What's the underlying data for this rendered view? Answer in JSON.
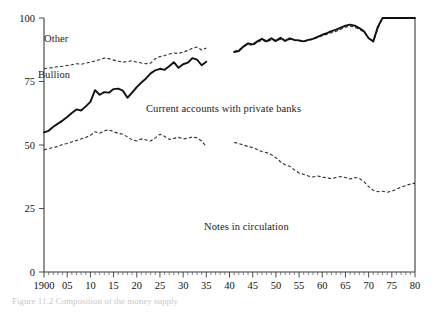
{
  "figure": {
    "caption": "Figure 11.2  Composition of the money supply"
  },
  "labels": {
    "other": "Other",
    "bullion": "Bullion",
    "current_accounts": "Current accounts with private banks",
    "notes": "Notes in circulation"
  },
  "chart_data": {
    "type": "line",
    "title": "",
    "xlabel": "",
    "ylabel": "",
    "xlim": [
      1900,
      1980
    ],
    "ylim": [
      0,
      100
    ],
    "grid": false,
    "legend": "inline-annotations",
    "ytick_labels": [
      "0",
      "25",
      "50",
      "75",
      "100"
    ],
    "ytick_values": [
      0,
      25,
      50,
      75,
      100
    ],
    "xtick_labels": [
      "1900",
      "05",
      "10",
      "15",
      "20",
      "25",
      "30",
      "35",
      "40",
      "45",
      "50",
      "55",
      "60",
      "65",
      "70",
      "75",
      "80"
    ],
    "xtick_values": [
      1900,
      1905,
      1910,
      1915,
      1920,
      1925,
      1930,
      1935,
      1940,
      1945,
      1950,
      1955,
      1960,
      1965,
      1970,
      1975,
      1980
    ],
    "x_minor_interval": 1,
    "annotations": [
      {
        "text": "Other",
        "x": 1902,
        "y": 93
      },
      {
        "text": "Bullion",
        "x": 1901,
        "y": 77
      },
      {
        "text": "Current accounts with private banks",
        "x": 1922,
        "y": 63
      },
      {
        "text": "Notes in circulation",
        "x": 1937,
        "y": 23
      }
    ],
    "series": [
      {
        "name": "Other",
        "style": "dashed",
        "segments": [
          {
            "x": [
              1900,
              1901,
              1902,
              1903,
              1904,
              1905,
              1906,
              1907,
              1908,
              1909,
              1910,
              1911,
              1912,
              1913,
              1914,
              1915,
              1916,
              1917,
              1918,
              1919,
              1920,
              1921,
              1922,
              1923,
              1924,
              1925,
              1926,
              1927,
              1928,
              1929,
              1930,
              1931,
              1932,
              1933,
              1934,
              1935
            ],
            "y": [
              80.0,
              80.3,
              80.5,
              80.8,
              81.0,
              81.3,
              81.6,
              82.0,
              81.8,
              82.2,
              82.6,
              83.1,
              83.6,
              84.2,
              84.0,
              83.4,
              83.0,
              82.6,
              82.8,
              83.2,
              82.6,
              82.3,
              82.0,
              82.2,
              84.0,
              84.8,
              85.2,
              85.8,
              86.2,
              86.0,
              86.6,
              87.2,
              88.1,
              88.6,
              87.4,
              88.2
            ]
          },
          {
            "x": [
              1941,
              1942,
              1943,
              1944,
              1945,
              1946,
              1947,
              1948,
              1949,
              1950,
              1951,
              1952,
              1953,
              1954,
              1955,
              1956,
              1957,
              1958,
              1959,
              1960,
              1961,
              1962,
              1963,
              1964,
              1965,
              1966,
              1967,
              1968,
              1969,
              1970,
              1971,
              1972,
              1973,
              1974,
              1975,
              1976,
              1977,
              1978,
              1979,
              1980
            ],
            "y": [
              86.8,
              87.4,
              88.6,
              89.6,
              89.2,
              90.4,
              91.3,
              90.6,
              91.4,
              90.8,
              91.6,
              90.9,
              91.6,
              91.2,
              91.0,
              90.7,
              91.2,
              91.6,
              92.3,
              93.0,
              93.6,
              94.2,
              94.8,
              95.6,
              96.4,
              96.8,
              96.4,
              95.6,
              94.4,
              92.2,
              90.6,
              95.8,
              100.0,
              100.0,
              100.0,
              100.0,
              100.0,
              100.0,
              100.0,
              100.0
            ]
          }
        ]
      },
      {
        "name": "Bullion",
        "style": "solid",
        "segments": [
          {
            "x": [
              1900,
              1901,
              1902,
              1903,
              1904,
              1905,
              1906,
              1907,
              1908,
              1909,
              1910,
              1911,
              1912,
              1913,
              1914,
              1915,
              1916,
              1917,
              1918,
              1919,
              1920,
              1921,
              1922,
              1923,
              1924,
              1925,
              1926,
              1927,
              1928,
              1929,
              1930,
              1931,
              1932,
              1933,
              1934,
              1935
            ],
            "y": [
              55.0,
              55.6,
              57.2,
              58.4,
              59.6,
              61.0,
              62.6,
              64.0,
              63.6,
              65.2,
              67.0,
              71.6,
              69.8,
              70.8,
              70.6,
              72.0,
              72.2,
              71.4,
              68.6,
              70.6,
              72.8,
              74.6,
              76.2,
              78.2,
              79.4,
              80.0,
              79.6,
              81.0,
              82.6,
              80.4,
              81.8,
              82.4,
              84.2,
              83.6,
              81.4,
              82.8
            ]
          },
          {
            "x": [
              1941,
              1942,
              1943,
              1944,
              1945,
              1946,
              1947,
              1948,
              1949,
              1950,
              1951,
              1952,
              1953,
              1954,
              1955,
              1956,
              1957,
              1958,
              1959,
              1960,
              1961,
              1962,
              1963,
              1964,
              1965,
              1966,
              1967,
              1968,
              1969,
              1970,
              1971,
              1972,
              1973,
              1974,
              1975,
              1976,
              1977,
              1978,
              1979,
              1980
            ],
            "y": [
              86.6,
              87.0,
              88.8,
              90.0,
              89.6,
              90.8,
              91.8,
              90.8,
              92.0,
              91.0,
              92.2,
              91.0,
              92.0,
              91.4,
              91.2,
              90.8,
              91.4,
              91.8,
              92.6,
              93.4,
              94.0,
              94.8,
              95.4,
              96.2,
              97.0,
              97.4,
              97.0,
              96.0,
              94.8,
              92.0,
              90.8,
              96.6,
              100.0,
              100.0,
              100.0,
              100.0,
              100.0,
              100.0,
              100.0,
              100.0
            ]
          }
        ]
      },
      {
        "name": "Notes in circulation",
        "style": "dashed",
        "segments": [
          {
            "x": [
              1900,
              1901,
              1902,
              1903,
              1904,
              1905,
              1906,
              1907,
              1908,
              1909,
              1910,
              1911,
              1912,
              1913,
              1914,
              1915,
              1916,
              1917,
              1918,
              1919,
              1920,
              1921,
              1922,
              1923,
              1924,
              1925,
              1926,
              1927,
              1928,
              1929,
              1930,
              1931,
              1932,
              1933,
              1934,
              1935
            ],
            "y": [
              48.0,
              48.6,
              49.0,
              49.4,
              50.2,
              50.6,
              51.2,
              51.8,
              52.4,
              53.0,
              53.8,
              55.2,
              54.6,
              55.6,
              56.0,
              55.2,
              54.6,
              54.2,
              53.2,
              52.0,
              51.6,
              52.4,
              52.0,
              51.6,
              52.8,
              54.2,
              53.4,
              52.2,
              52.6,
              53.0,
              52.4,
              52.6,
              53.2,
              52.8,
              51.6,
              49.4
            ]
          },
          {
            "x": [
              1941,
              1942,
              1943,
              1944,
              1945,
              1946,
              1947,
              1948,
              1949,
              1950,
              1951,
              1952,
              1953,
              1954,
              1955,
              1956,
              1957,
              1958,
              1959,
              1960,
              1961,
              1962,
              1963,
              1964,
              1965,
              1966,
              1967,
              1968,
              1969,
              1970,
              1971,
              1972,
              1973,
              1974,
              1975,
              1976,
              1977,
              1978,
              1979,
              1980
            ],
            "y": [
              51.0,
              50.6,
              50.0,
              49.4,
              49.0,
              48.2,
              47.4,
              47.0,
              46.2,
              45.0,
              43.4,
              42.2,
              41.6,
              40.2,
              39.0,
              38.4,
              37.8,
              37.4,
              37.8,
              37.4,
              37.0,
              36.8,
              37.2,
              37.6,
              37.2,
              36.6,
              37.2,
              36.8,
              35.6,
              33.6,
              32.2,
              31.6,
              31.8,
              31.4,
              31.8,
              32.6,
              33.4,
              34.0,
              34.6,
              35.0
            ]
          }
        ]
      }
    ]
  }
}
